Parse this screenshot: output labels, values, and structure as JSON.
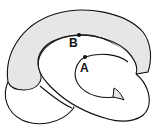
{
  "diagram": {
    "colors": {
      "stroke": "#111111",
      "shaded_band": "#e6e6e6",
      "background": "#ffffff"
    },
    "points": [
      {
        "label": "B",
        "x": 79,
        "y": 35
      },
      {
        "label": "A",
        "x": 85,
        "y": 57
      }
    ]
  }
}
